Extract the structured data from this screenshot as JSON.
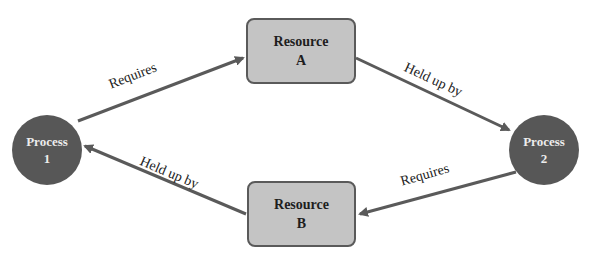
{
  "diagram": {
    "type": "resource-allocation-deadlock",
    "nodes": [
      {
        "id": "p1",
        "kind": "process",
        "line1": "Process",
        "line2": "1"
      },
      {
        "id": "ra",
        "kind": "resource",
        "line1": "Resource",
        "line2": "A"
      },
      {
        "id": "p2",
        "kind": "process",
        "line1": "Process",
        "line2": "2"
      },
      {
        "id": "rb",
        "kind": "resource",
        "line1": "Resource",
        "line2": "B"
      }
    ],
    "edges": [
      {
        "from": "p1",
        "to": "ra",
        "label": "Requires"
      },
      {
        "from": "ra",
        "to": "p2",
        "label": "Held up by"
      },
      {
        "from": "p2",
        "to": "rb",
        "label": "Requires"
      },
      {
        "from": "rb",
        "to": "p1",
        "label": "Held up by"
      }
    ],
    "colors": {
      "process_fill": "#575757",
      "resource_fill": "#c4c4c4",
      "resource_border": "#5a5a5a",
      "arrow": "#5a5a5a"
    }
  }
}
